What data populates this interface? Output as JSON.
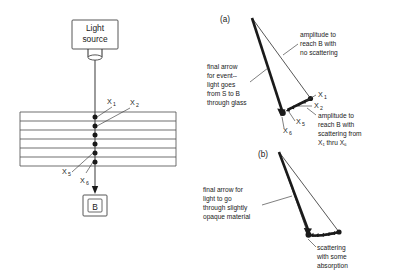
{
  "figure": {
    "left_panel": {
      "source_box_label_line1": "Light",
      "source_box_label_line2": "source",
      "detector_box_label": "B",
      "scatter_labels": [
        {
          "name": "x1",
          "text": "X",
          "sub": "1"
        },
        {
          "name": "x2",
          "text": "X",
          "sub": "2"
        },
        {
          "name": "x5",
          "text": "X",
          "sub": "5"
        },
        {
          "name": "x6",
          "text": "X",
          "sub": "6"
        }
      ],
      "glass_layers": 6,
      "scatter_points": 6
    },
    "panel_a": {
      "label": "(a)",
      "annotations": [
        {
          "name": "amplitude-no-scattering",
          "lines": [
            "amplitude to",
            "reach B with",
            "no scattering"
          ]
        },
        {
          "name": "final-arrow-event",
          "lines": [
            "final arrow",
            "for event--",
            "light goes",
            "from S to B",
            "through glass"
          ]
        },
        {
          "name": "amplitude-with-scattering",
          "lines": [
            "amplitude to",
            "reach B with",
            "scattering from",
            "X₁ thru X₆"
          ]
        }
      ],
      "vector_labels": [
        {
          "name": "x1",
          "text": "X",
          "sub": "1"
        },
        {
          "name": "x2",
          "text": "X",
          "sub": "2"
        },
        {
          "name": "x5",
          "text": "X",
          "sub": "5"
        },
        {
          "name": "x6",
          "text": "X",
          "sub": "6"
        }
      ]
    },
    "panel_b": {
      "label": "(b)",
      "annotations": [
        {
          "name": "final-arrow-opaque",
          "lines": [
            "final arrow for",
            "light to go",
            "through slightly",
            "opaque material"
          ]
        },
        {
          "name": "scattering-absorption",
          "lines": [
            "scattering",
            "with some",
            "absorption"
          ]
        }
      ]
    },
    "colors": {
      "ink": "#1a1a1a",
      "line": "#2b2b2b",
      "slab": "#555555",
      "background": "#ffffff"
    }
  }
}
